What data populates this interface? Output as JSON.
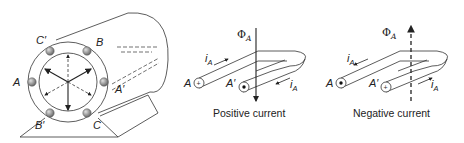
{
  "figure": {
    "machine": {
      "slot_labels": {
        "A": "A",
        "A_prime": "A′",
        "B": "B",
        "B_prime": "B′",
        "C": "C",
        "C_prime": "C′"
      }
    },
    "positive_coil": {
      "flux_symbol": "Φ",
      "flux_sub": "A",
      "current_symbol": "i",
      "current_sub": "A",
      "terminal_start": "A",
      "terminal_end": "A′",
      "caption": "Positive current"
    },
    "negative_coil": {
      "flux_symbol": "Φ",
      "flux_sub": "A",
      "current_symbol": "i",
      "current_sub": "A",
      "terminal_start": "A",
      "terminal_end": "A′",
      "caption": "Negative current"
    }
  },
  "colors": {
    "line": "#333333",
    "conductor": "#8a8a8a",
    "conductor_highlight": "#d0d0d0"
  }
}
